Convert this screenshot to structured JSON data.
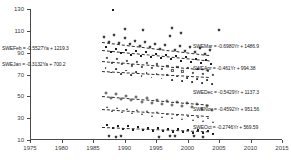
{
  "chart_data": {
    "type": "scatter",
    "title": "",
    "xlabel": "",
    "ylabel": "",
    "xlim": [
      1975,
      2015
    ],
    "ylim": [
      10,
      130
    ],
    "xticks": [
      1975,
      1980,
      1985,
      1990,
      1995,
      2000,
      2005,
      2010,
      2015
    ],
    "yticks": [
      10,
      30,
      50,
      70,
      90,
      110,
      130
    ],
    "grid": false,
    "legend": "none",
    "annotations": [
      {
        "name": "SWEFeb",
        "text": "SWEFeb = -0.5527Ya + 1219.3",
        "slope": -0.5527,
        "intercept": 1219.3,
        "x": 2,
        "y": 46
      },
      {
        "name": "SWEJan",
        "text": "SWEJan = -0.3132Ya + 700.2",
        "slope": -0.3132,
        "intercept": 700.2,
        "x": 2,
        "y": 62
      },
      {
        "name": "SWEMar",
        "text": "SWEMar = -0.6980Yr + 1486.9",
        "slope": -0.698,
        "intercept": 1486.9,
        "x": 193,
        "y": 44
      },
      {
        "name": "SWEApr",
        "text": "SWEApr = -0.461Yr + 994.38",
        "slope": -0.461,
        "intercept": 994.38,
        "x": 193,
        "y": 66
      },
      {
        "name": "SWEDec",
        "text": "SWEDec = -0.5429Yr + 1137.3",
        "slope": -0.5429,
        "intercept": 1137.3,
        "x": 193,
        "y": 90
      },
      {
        "name": "SWENov",
        "text": "SWENov = -0.4592Yr + 951.56",
        "slope": -0.4592,
        "intercept": 951.56,
        "x": 193,
        "y": 107
      },
      {
        "name": "SWEOct",
        "text": "SWEOct = -0.2746Yr + 569.59",
        "slope": -0.2746,
        "intercept": 569.59,
        "x": 193,
        "y": 125
      }
    ],
    "series": [
      {
        "name": "SWEMar",
        "marker": "m-cross",
        "trend": {
          "x0": 1986.5,
          "y0": 100.0,
          "x1": 2003.5,
          "y1": 88.0
        },
        "points": [
          [
            1986.8,
            104.5
          ],
          [
            1987.6,
            100.2
          ],
          [
            1988.4,
            105.8
          ],
          [
            1989.2,
            99.0
          ],
          [
            1990.0,
            103.4
          ],
          [
            1990.8,
            97.6
          ],
          [
            1991.6,
            101.0
          ],
          [
            1992.4,
            96.2
          ],
          [
            1993.2,
            99.8
          ],
          [
            1994.0,
            94.8
          ],
          [
            1994.8,
            98.2
          ],
          [
            1995.6,
            93.4
          ],
          [
            1996.4,
            97.0
          ],
          [
            1997.2,
            105.2
          ],
          [
            1998.0,
            92.6
          ],
          [
            1998.8,
            96.0
          ],
          [
            1999.6,
            91.2
          ],
          [
            2000.4,
            95.4
          ],
          [
            2001.2,
            90.4
          ],
          [
            2002.0,
            94.0
          ],
          [
            2002.8,
            89.2
          ],
          [
            2003.6,
            92.8
          ]
        ]
      },
      {
        "name": "SWEFeb",
        "marker": "m-square",
        "trend": {
          "x0": 1986.5,
          "y0": 92.0,
          "x1": 2003.5,
          "y1": 82.5
        },
        "points": [
          [
            1987.0,
            95.0
          ],
          [
            1987.8,
            90.6
          ],
          [
            1988.6,
            93.8
          ],
          [
            1989.4,
            89.4
          ],
          [
            1990.2,
            92.6
          ],
          [
            1991.0,
            88.2
          ],
          [
            1991.8,
            91.4
          ],
          [
            1992.6,
            87.0
          ],
          [
            1993.4,
            90.2
          ],
          [
            1994.2,
            86.0
          ],
          [
            1995.0,
            89.0
          ],
          [
            1995.8,
            84.8
          ],
          [
            1996.6,
            88.0
          ],
          [
            1997.4,
            83.8
          ],
          [
            1998.2,
            86.8
          ],
          [
            1999.0,
            82.6
          ],
          [
            1999.8,
            85.8
          ],
          [
            2000.6,
            81.6
          ],
          [
            2001.4,
            84.6
          ],
          [
            2002.2,
            80.4
          ],
          [
            2003.0,
            83.4
          ],
          [
            2003.8,
            79.4
          ]
        ]
      },
      {
        "name": "SWEApr",
        "marker": "m-open",
        "trend": {
          "x0": 1986.5,
          "y0": 82.0,
          "x1": 2003.5,
          "y1": 74.0
        },
        "points": [
          [
            1987.2,
            85.4
          ],
          [
            1988.0,
            80.8
          ],
          [
            1988.8,
            84.0
          ],
          [
            1989.6,
            79.6
          ],
          [
            1990.4,
            82.8
          ],
          [
            1991.2,
            78.4
          ],
          [
            1992.0,
            81.6
          ],
          [
            1992.8,
            77.2
          ],
          [
            1993.6,
            80.4
          ],
          [
            1994.4,
            76.2
          ],
          [
            1995.2,
            79.2
          ],
          [
            1996.0,
            75.0
          ],
          [
            1996.8,
            78.2
          ],
          [
            1997.6,
            73.8
          ],
          [
            1998.4,
            77.0
          ],
          [
            1999.2,
            72.8
          ],
          [
            2000.0,
            76.0
          ],
          [
            2000.8,
            71.6
          ],
          [
            2001.6,
            74.8
          ],
          [
            2002.4,
            70.6
          ],
          [
            2003.2,
            73.6
          ],
          [
            2004.0,
            69.4
          ]
        ]
      },
      {
        "name": "SWEJan",
        "marker": "m-dot",
        "trend": {
          "x0": 1986.5,
          "y0": 73.0,
          "x1": 2003.5,
          "y1": 67.5
        },
        "points": [
          [
            1987.0,
            76.0
          ],
          [
            1987.9,
            71.8
          ],
          [
            1988.7,
            74.8
          ],
          [
            1989.5,
            70.6
          ],
          [
            1990.3,
            73.6
          ],
          [
            1991.1,
            69.4
          ],
          [
            1991.9,
            72.4
          ],
          [
            1992.7,
            68.4
          ],
          [
            1993.5,
            71.4
          ],
          [
            1994.3,
            67.2
          ],
          [
            1995.1,
            70.2
          ],
          [
            1995.9,
            66.2
          ],
          [
            1996.7,
            69.2
          ],
          [
            1997.5,
            65.2
          ],
          [
            1998.3,
            68.0
          ],
          [
            1999.1,
            64.0
          ],
          [
            1999.9,
            67.0
          ],
          [
            2000.7,
            63.0
          ],
          [
            2001.5,
            66.0
          ],
          [
            2002.3,
            62.0
          ],
          [
            2003.1,
            65.0
          ],
          [
            2003.9,
            61.0
          ]
        ]
      },
      {
        "name": "SWEDec",
        "marker": "m-plus",
        "trend": {
          "x0": 1986.5,
          "y0": 50.0,
          "x1": 2003.5,
          "y1": 42.0
        },
        "points": [
          [
            1987.1,
            53.0
          ],
          [
            1987.9,
            48.6
          ],
          [
            1988.7,
            51.8
          ],
          [
            1989.5,
            47.4
          ],
          [
            1990.3,
            50.6
          ],
          [
            1991.1,
            46.2
          ],
          [
            1991.9,
            49.4
          ],
          [
            1992.7,
            45.0
          ],
          [
            1993.5,
            48.2
          ],
          [
            1994.3,
            44.0
          ],
          [
            1995.1,
            47.0
          ],
          [
            1995.9,
            43.0
          ],
          [
            1996.7,
            46.0
          ],
          [
            1997.5,
            41.8
          ],
          [
            1998.3,
            45.0
          ],
          [
            1999.1,
            40.8
          ],
          [
            1999.9,
            43.8
          ],
          [
            2000.7,
            39.8
          ],
          [
            2001.5,
            42.8
          ],
          [
            2002.3,
            38.8
          ],
          [
            2003.1,
            41.6
          ],
          [
            2003.9,
            37.8
          ]
        ]
      },
      {
        "name": "SWENov",
        "marker": "m-tri",
        "trend": {
          "x0": 1986.5,
          "y0": 38.0,
          "x1": 2003.5,
          "y1": 31.5
        },
        "points": [
          [
            1987.2,
            40.6
          ],
          [
            1988.0,
            36.6
          ],
          [
            1988.8,
            39.4
          ],
          [
            1989.6,
            35.4
          ],
          [
            1990.4,
            38.4
          ],
          [
            1991.2,
            34.4
          ],
          [
            1992.0,
            37.2
          ],
          [
            1992.8,
            33.4
          ],
          [
            1993.6,
            36.2
          ],
          [
            1994.4,
            32.4
          ],
          [
            1995.2,
            35.2
          ],
          [
            1996.0,
            31.4
          ],
          [
            1996.8,
            34.2
          ],
          [
            1997.6,
            30.4
          ],
          [
            1998.4,
            33.2
          ],
          [
            1999.2,
            29.6
          ],
          [
            2000.0,
            32.2
          ],
          [
            2000.8,
            28.6
          ],
          [
            2001.6,
            31.2
          ],
          [
            2002.4,
            27.8
          ],
          [
            2003.2,
            30.2
          ],
          [
            2004.0,
            26.8
          ]
        ]
      },
      {
        "name": "SWEOct",
        "marker": "m-square",
        "trend": {
          "x0": 1986.5,
          "y0": 22.0,
          "x1": 2003.5,
          "y1": 18.0
        },
        "points": [
          [
            1987.3,
            24.0
          ],
          [
            1988.1,
            20.8
          ],
          [
            1988.9,
            23.2
          ],
          [
            1989.7,
            20.2
          ],
          [
            1990.5,
            22.6
          ],
          [
            1991.3,
            19.6
          ],
          [
            1992.1,
            22.0
          ],
          [
            1992.9,
            19.0
          ],
          [
            1993.7,
            21.4
          ],
          [
            1994.5,
            18.6
          ],
          [
            1995.3,
            20.8
          ],
          [
            1996.1,
            18.0
          ],
          [
            1996.9,
            20.4
          ],
          [
            1997.7,
            17.6
          ],
          [
            1998.5,
            19.8
          ],
          [
            1999.3,
            17.2
          ],
          [
            2000.1,
            19.2
          ],
          [
            2000.9,
            16.6
          ],
          [
            2001.7,
            18.8
          ],
          [
            2002.5,
            16.2
          ],
          [
            2003.3,
            18.2
          ],
          [
            2004.1,
            15.8
          ]
        ]
      },
      {
        "name": "outlier-high",
        "marker": "m-square",
        "trend": null,
        "points": [
          [
            1988.2,
            129.0
          ]
        ]
      },
      {
        "name": "scatter-extra-upper",
        "marker": "m-cross",
        "trend": null,
        "points": [
          [
            1990.0,
            112.0
          ],
          [
            1993.0,
            111.0
          ],
          [
            1997.5,
            112.5
          ],
          [
            2005.0,
            111.0
          ],
          [
            1999.0,
            108.0
          ]
        ]
      },
      {
        "name": "scatter-extra-low",
        "marker": "m-cross",
        "trend": null,
        "points": [
          [
            1987.5,
            14.0
          ],
          [
            1988.6,
            12.6
          ],
          [
            1989.4,
            13.4
          ],
          [
            1995.5,
            13.0
          ],
          [
            1997.2,
            13.8
          ],
          [
            1998.0,
            13.4
          ],
          [
            2001.0,
            13.6
          ],
          [
            2002.4,
            12.8
          ]
        ]
      }
    ]
  }
}
